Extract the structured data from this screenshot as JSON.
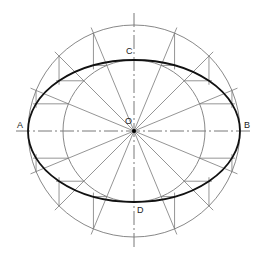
{
  "diagram": {
    "center": {
      "x": 134,
      "y": 131
    },
    "major_radius": 106,
    "minor_radius": 71,
    "radial_angles_deg": [
      22.5,
      45,
      67.5,
      112.5,
      135,
      157.5,
      202.5,
      225,
      247.5,
      292.5,
      315,
      337.5
    ],
    "radial_overhang": 6,
    "colors": {
      "construction": "#7a7a7a",
      "ellipse": "#111111",
      "axis": "#555555",
      "label": "#222222"
    },
    "labels": {
      "A": {
        "text": "A",
        "x": 17,
        "y": 128
      },
      "B": {
        "text": "B",
        "x": 244,
        "y": 128
      },
      "C": {
        "text": "C",
        "x": 126,
        "y": 54
      },
      "D": {
        "text": "D",
        "x": 137,
        "y": 213
      },
      "O": {
        "text": "O",
        "x": 125,
        "y": 124
      }
    }
  }
}
